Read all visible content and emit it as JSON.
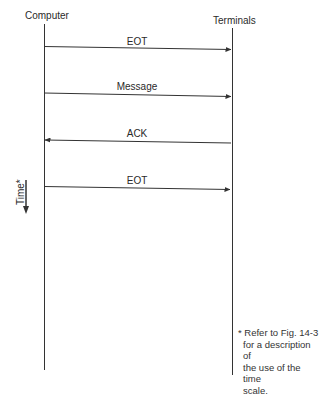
{
  "diagram": {
    "type": "sequence-diagram",
    "participants": [
      {
        "id": "computer",
        "label": "Computer"
      },
      {
        "id": "terminals",
        "label": "Terminals"
      }
    ],
    "messages": [
      {
        "label": "EOT",
        "from": "computer",
        "to": "terminals"
      },
      {
        "label": "Message",
        "from": "computer",
        "to": "terminals"
      },
      {
        "label": "ACK",
        "from": "terminals",
        "to": "computer"
      },
      {
        "label": "EOT",
        "from": "computer",
        "to": "terminals"
      }
    ],
    "time_axis": {
      "label": "Time*",
      "direction": "down"
    },
    "footnote": {
      "lines": [
        "* Refer to Fig. 14-3",
        "for a description of",
        "the use of the time",
        "scale."
      ]
    }
  }
}
